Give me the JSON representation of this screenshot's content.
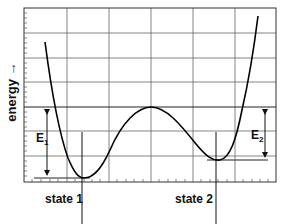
{
  "diagram": {
    "type": "energy-landscape",
    "y_axis_label": "energy →",
    "states": [
      {
        "label": "state 1",
        "energy_gap_label": "E",
        "energy_gap_subscript": "1"
      },
      {
        "label": "state 2",
        "energy_gap_label": "E",
        "energy_gap_subscript": "2"
      }
    ],
    "colors": {
      "curve": "#000000",
      "grid": "#555555",
      "frame": "#333333",
      "background": "#ffffff"
    }
  }
}
